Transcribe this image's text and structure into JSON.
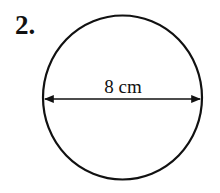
{
  "problem": {
    "number": "2."
  },
  "figure": {
    "shape": "circle",
    "diameter_label": "8 cm",
    "stroke_color": "#111111"
  }
}
